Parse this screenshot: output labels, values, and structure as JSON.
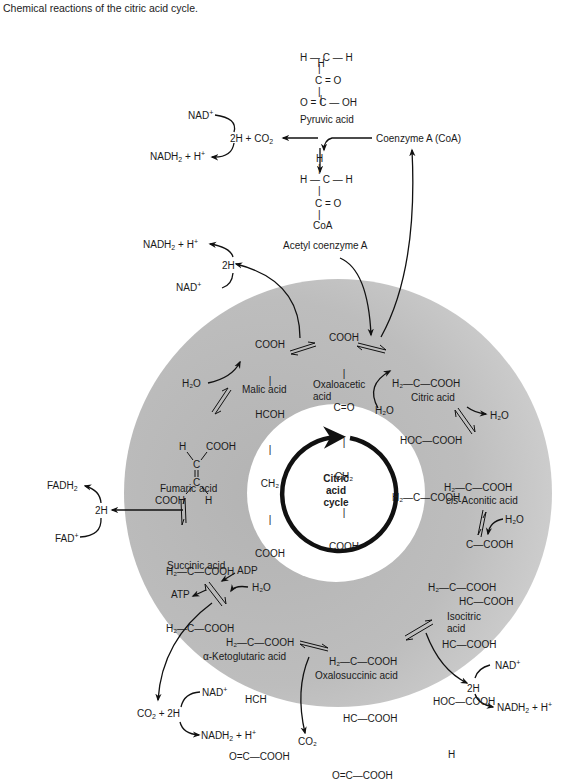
{
  "caption": "Chemical reactions of the citric acid cycle.",
  "colors": {
    "ring_gray_dark": "#b3b3b3",
    "ring_gray_light": "#d2d2d2",
    "ink": "#1a1a1a",
    "background": "#ffffff"
  },
  "center": {
    "line1": "Citric",
    "line2": "acid",
    "line3": "cycle"
  },
  "entry": {
    "pyruvic_acid": {
      "label": "Pyruvic acid",
      "structure": [
        "H",
        "|",
        "H — C — H",
        "|",
        "C = O",
        "|",
        "O = C — OH"
      ]
    },
    "acetyl_coa": {
      "label": "Acetyl coenzyme A",
      "structure": [
        "H",
        "|",
        "H — C — H",
        "|",
        "C = O",
        "|",
        "CoA"
      ]
    },
    "coenzyme_a": "Coenzyme A (CoA)",
    "decarboxylation": {
      "nad": "NAD",
      "product": "2H + CO",
      "nadh": "NADH",
      "nadh_suffix": " + H"
    }
  },
  "molecules": {
    "oxaloacetic": {
      "label_line1": "Oxaloacetic",
      "label_line2": "acid",
      "structure": [
        "COOH",
        "|",
        "C=O",
        "|",
        "CH₂",
        "|",
        "COOH"
      ]
    },
    "citric": {
      "label": "Citric acid",
      "structure": [
        "H₂—C—COOH",
        "HOC—COOH",
        "H₂—C—COOH"
      ]
    },
    "cis_aconitic": {
      "label_prefix": "cis",
      "label_rest": "-Aconitic acid",
      "structure": [
        "H₂—C—COOH",
        "C—COOH",
        "HC—COOH"
      ]
    },
    "isocitric": {
      "label_line1": "Isocitric",
      "label_line2": "acid",
      "structure": [
        "H₂—C—COOH",
        "HC—COOH",
        "HOC—COOH",
        "H"
      ]
    },
    "oxalosuccinic": {
      "label": "Oxalosuccinic acid",
      "structure": [
        "H₂—C—COOH",
        "HC—COOH",
        "O=C—COOH"
      ]
    },
    "alpha_ketoglutaric": {
      "label_prefix": "α",
      "label_rest": "-Ketoglutaric acid",
      "structure": [
        "H₂—C—COOH",
        "HCH",
        "O=C—COOH"
      ]
    },
    "succinic": {
      "label": "Succinic acid",
      "structure": [
        "H₂—C—COOH",
        "H₂—C—COOH"
      ]
    },
    "fumaric": {
      "label": "Fumaric acid",
      "structure": [
        "H",
        "COOH",
        "C",
        "C",
        "COOH",
        "H"
      ]
    },
    "malic": {
      "label": "Malic acid",
      "structure": [
        "COOH",
        "HCOH",
        "CH₂",
        "COOH"
      ]
    }
  },
  "side_reactions": {
    "malate_dehydrogenase": {
      "nadh": "NADH",
      "nadh_suffix": " + H",
      "h2": "2H",
      "nad": "NAD"
    },
    "water_malic": "H₂O",
    "water_citric_in": "H₂O",
    "water_citric_out": "H₂O",
    "water_isocitric": "H₂O",
    "isocitrate_dehydrogenase": {
      "nad": "NAD",
      "h2": "2H",
      "nadh": "NADH",
      "nadh_suffix": " + H"
    },
    "oxalosuccinate_co2": "CO₂",
    "ketoglutarate": {
      "co2_2h": "CO₂ + 2H",
      "nad": "NAD",
      "nadh": "NADH",
      "nadh_suffix": " + H"
    },
    "succinyl": {
      "adp": "ADP",
      "atp": "ATP",
      "water": "H₂O"
    },
    "succinate_dehydrogenase": {
      "fadh2": "FADH",
      "h2": "2H",
      "fad": "FAD"
    }
  }
}
